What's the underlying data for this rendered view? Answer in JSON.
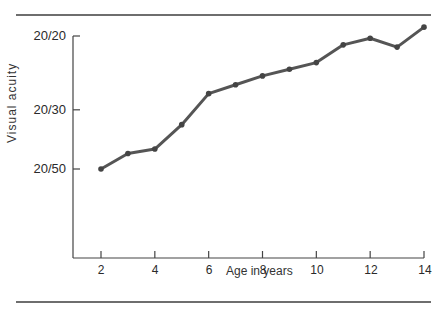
{
  "chart_data": {
    "type": "line",
    "title": "",
    "xlabel": "Age in years",
    "ylabel": "Visual acuity",
    "x_ticks": [
      2,
      4,
      6,
      8,
      10,
      12,
      14
    ],
    "y_ticks": [
      {
        "label": "20/20",
        "decimal": 1.0
      },
      {
        "label": "20/30",
        "decimal": 0.667
      },
      {
        "label": "20/50",
        "decimal": 0.4
      }
    ],
    "xlim": [
      1,
      14
    ],
    "ylim_decimal_acuity": [
      0.0,
      1.09
    ],
    "grid": false,
    "legend": null,
    "series": [
      {
        "name": "Visual acuity",
        "x": [
          2,
          3,
          4,
          5,
          6,
          7,
          8,
          9,
          10,
          11,
          12,
          13,
          14
        ],
        "values_decimal_acuity": [
          0.4,
          0.47,
          0.49,
          0.6,
          0.74,
          0.78,
          0.82,
          0.85,
          0.88,
          0.96,
          0.99,
          0.95,
          1.04
        ],
        "color": "#555555"
      }
    ]
  },
  "labels": {
    "xlabel": "Age in years",
    "ylabel": "Visual acuity",
    "yticks": [
      "20/20",
      "20/30",
      "20/50"
    ],
    "xticks": [
      "2",
      "4",
      "6",
      "8",
      "10",
      "12",
      "14"
    ]
  },
  "colors": {
    "line": "#555555",
    "axis": "#444444",
    "rule": "#6e6e6e"
  }
}
